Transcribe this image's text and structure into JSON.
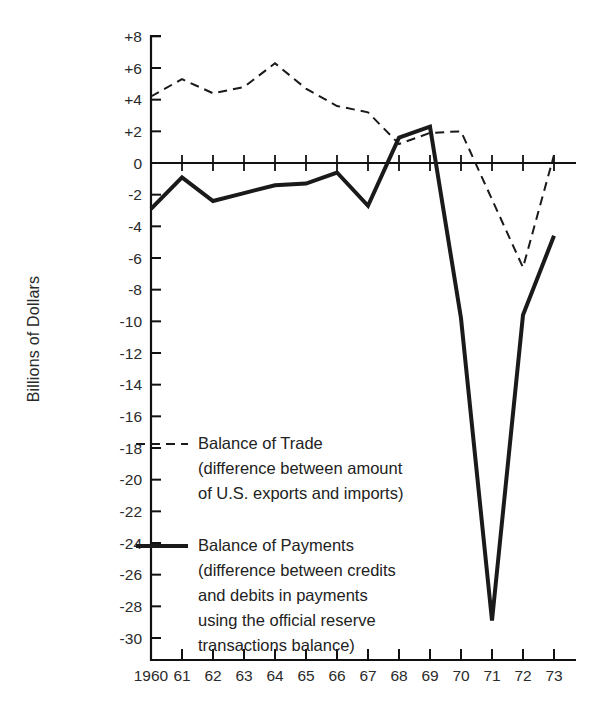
{
  "chart_data": {
    "type": "line",
    "title": "",
    "xlabel": "",
    "ylabel": "Billions of Dollars",
    "grid": false,
    "legend_position": "inside-left",
    "x": [
      1960,
      1961,
      1962,
      1963,
      1964,
      1965,
      1966,
      1967,
      1968,
      1969,
      1970,
      1971,
      1972,
      1973
    ],
    "xtick_labels": [
      "1960",
      "61",
      "62",
      "63",
      "64",
      "65",
      "66",
      "67",
      "68",
      "69",
      "70",
      "71",
      "72",
      "73"
    ],
    "ytick_labels": [
      "+8",
      "+6",
      "+4",
      "+2",
      "0",
      "-2",
      "-4",
      "-6",
      "-8",
      "-10",
      "-12",
      "-14",
      "-16",
      "-18",
      "-20",
      "-22",
      "-24",
      "-26",
      "-28",
      "-30"
    ],
    "ytick_values": [
      8,
      6,
      4,
      2,
      0,
      -2,
      -4,
      -6,
      -8,
      -10,
      -12,
      -14,
      -16,
      -18,
      -20,
      -22,
      -24,
      -26,
      -28,
      -30
    ],
    "ylim": [
      -31,
      8
    ],
    "xlim": [
      1959.6,
      1973.6
    ],
    "series": [
      {
        "name": "Balance of Trade",
        "style": "dashed",
        "color": "#1a1a1a",
        "values": [
          4.2,
          5.3,
          4.4,
          4.8,
          6.3,
          4.7,
          3.6,
          3.2,
          1.2,
          1.9,
          2.0,
          -2.3,
          -6.6,
          0.5
        ]
      },
      {
        "name": "Balance of Payments",
        "style": "solid",
        "color": "#1a1a1a",
        "values": [
          -2.9,
          -0.9,
          -2.4,
          -1.9,
          -1.4,
          -1.3,
          -0.6,
          -2.7,
          1.6,
          2.3,
          -9.8,
          -28.9,
          -9.6,
          -4.6
        ]
      }
    ]
  },
  "legend": {
    "entries": [
      {
        "swatch": "dashed-line-swatch",
        "title": "Balance of Trade",
        "lines": [
          "(difference between amount",
          "of U.S. exports and imports)"
        ]
      },
      {
        "swatch": "solid-line-swatch",
        "title": "Balance of Payments",
        "lines": [
          "(difference between credits",
          "and debits in payments",
          "using the official reserve",
          "transactions balance)"
        ]
      }
    ]
  },
  "colors": {
    "ink": "#1a1a1a",
    "axis": "#111111",
    "background": "#ffffff"
  }
}
